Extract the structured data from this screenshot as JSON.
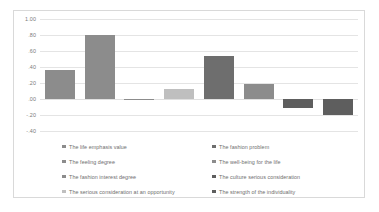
{
  "chart_data": {
    "type": "bar",
    "title": "",
    "xlabel": "",
    "ylabel": "",
    "ylim": [
      -0.4,
      1.0
    ],
    "grid": true,
    "legend_position": "bottom",
    "y_ticks": [
      "1.00",
      ".80",
      ".60",
      ".40",
      ".20",
      ".00",
      "-.20",
      "-.40"
    ],
    "y_tick_values": [
      1.0,
      0.8,
      0.6,
      0.4,
      0.2,
      0.0,
      -0.2,
      -0.4
    ],
    "categories": [
      "The life emphasis value",
      "The feeling degree",
      "The fashion interest degree",
      "The serious consideration at an opportunity",
      "The fashion problem",
      "The well-being for the life",
      "The culture serious consideration",
      "The strength of the individuality"
    ],
    "values": [
      0.36,
      0.8,
      -0.01,
      0.12,
      0.54,
      0.19,
      -0.11,
      -0.2
    ],
    "colors": [
      "#8c8c8c",
      "#8c8c8c",
      "#8c8c8c",
      "#bfbfbf",
      "#6e6e6e",
      "#8c8c8c",
      "#5e5e5e",
      "#5e5e5e"
    ]
  },
  "legend": {
    "items": [
      {
        "label": "The life emphasis value",
        "color": "#8c8c8c"
      },
      {
        "label": "The feeling degree",
        "color": "#8c8c8c"
      },
      {
        "label": "The fashion interest degree",
        "color": "#8c8c8c"
      },
      {
        "label": "The serious consideration at an opportunity",
        "color": "#bfbfbf"
      },
      {
        "label": "The fashion problem",
        "color": "#6e6e6e"
      },
      {
        "label": "The well-being for the life",
        "color": "#8c8c8c"
      },
      {
        "label": "The culture serious consideration",
        "color": "#5e5e5e"
      },
      {
        "label": "The strength of the individuality",
        "color": "#5e5e5e"
      }
    ]
  }
}
